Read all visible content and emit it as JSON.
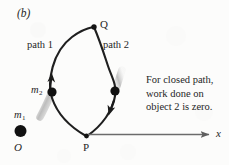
{
  "figure": {
    "panel_label": "(b)",
    "caption_lines": [
      "For closed path,",
      "work done on",
      "object 2 is zero."
    ],
    "points": {
      "q": "Q",
      "p": "P",
      "origin": "O"
    },
    "paths": {
      "path1": "path 1",
      "path2": "path 2"
    },
    "masses": {
      "m2_symbol": "m",
      "m2_subscript": "2",
      "m1_symbol": "m",
      "m1_subscript": "1"
    },
    "axis": {
      "x_label": "x"
    },
    "colors": {
      "ink": "#1b1b1b",
      "background": "#fcfcfb",
      "axis": "#6b6b6b",
      "blur": "#b9b9b9"
    }
  }
}
